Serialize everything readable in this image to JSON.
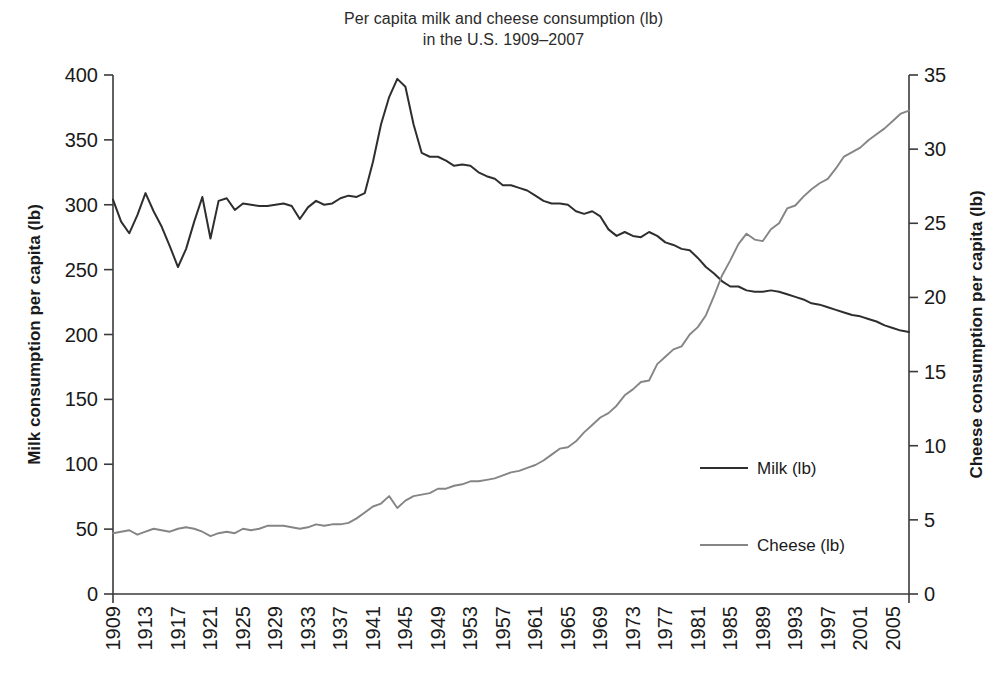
{
  "chart_data": {
    "type": "line",
    "title": "Per capita milk and cheese consumption (lb)",
    "subtitle": "in the U.S. 1909–2007",
    "title_lines": [
      "Per capita milk and cheese consumption (lb)",
      "in the U.S. 1909–2007"
    ],
    "xlabel": "",
    "ylabel": "Milk consumption per capita (lb)",
    "y2label": "Cheese consumption per capita (lb)",
    "xlim": [
      1909,
      2007
    ],
    "ylim": [
      0,
      400
    ],
    "y2lim": [
      0,
      35
    ],
    "yticks": [
      0,
      50,
      100,
      150,
      200,
      250,
      300,
      350,
      400
    ],
    "y2ticks": [
      0,
      5,
      10,
      15,
      20,
      25,
      30,
      35
    ],
    "xticks": [
      1909,
      1913,
      1917,
      1921,
      1925,
      1929,
      1933,
      1937,
      1941,
      1945,
      1949,
      1953,
      1957,
      1961,
      1965,
      1969,
      1973,
      1977,
      1981,
      1985,
      1989,
      1993,
      1997,
      2001,
      2005
    ],
    "xtick_labels": [
      "1909",
      "1913",
      "1917",
      "1921",
      "1925",
      "1929",
      "1933",
      "1937",
      "1941",
      "1945",
      "1949",
      "1953",
      "1957",
      "1961",
      "1965",
      "1969",
      "1973",
      "1977",
      "1981",
      "1985",
      "1989",
      "1993",
      "1997",
      "2001",
      "2005"
    ],
    "grid": false,
    "legend_position": "center-right",
    "colors": {
      "milk": "#2e2e2e",
      "cheese": "#858585"
    },
    "x": [
      1909,
      1910,
      1911,
      1912,
      1913,
      1914,
      1915,
      1916,
      1917,
      1918,
      1919,
      1920,
      1921,
      1922,
      1923,
      1924,
      1925,
      1926,
      1927,
      1928,
      1929,
      1930,
      1931,
      1932,
      1933,
      1934,
      1935,
      1936,
      1937,
      1938,
      1939,
      1940,
      1941,
      1942,
      1943,
      1944,
      1945,
      1946,
      1947,
      1948,
      1949,
      1950,
      1951,
      1952,
      1953,
      1954,
      1955,
      1956,
      1957,
      1958,
      1959,
      1960,
      1961,
      1962,
      1963,
      1964,
      1965,
      1966,
      1967,
      1968,
      1969,
      1970,
      1971,
      1972,
      1973,
      1974,
      1975,
      1976,
      1977,
      1978,
      1979,
      1980,
      1981,
      1982,
      1983,
      1984,
      1985,
      1986,
      1987,
      1988,
      1989,
      1990,
      1991,
      1992,
      1993,
      1994,
      1995,
      1996,
      1997,
      1998,
      1999,
      2000,
      2001,
      2002,
      2003,
      2004,
      2005,
      2006,
      2007
    ],
    "series": [
      {
        "name": "Milk (lb)",
        "axis": "left",
        "color": "#2e2e2e",
        "values": [
          304,
          287,
          278,
          292,
          309,
          295,
          283,
          268,
          252,
          266,
          287,
          306,
          274,
          303,
          305,
          296,
          301,
          300,
          299,
          299,
          300,
          301,
          299,
          289,
          298,
          303,
          300,
          301,
          305,
          307,
          306,
          309,
          333,
          362,
          383,
          397,
          391,
          362,
          340,
          337,
          337,
          334,
          330,
          331,
          330,
          325,
          322,
          320,
          315,
          315,
          313,
          311,
          307,
          303,
          301,
          301,
          300,
          295,
          293,
          295,
          291,
          281,
          276,
          279,
          276,
          275,
          279,
          276,
          271,
          269,
          266,
          265,
          259,
          252,
          247,
          241,
          237,
          237,
          234,
          233,
          233,
          234,
          233,
          231,
          229,
          227,
          224,
          223,
          221,
          219,
          217,
          215,
          214,
          212,
          210,
          207,
          205,
          203,
          202
        ]
      },
      {
        "name": "Cheese (lb)",
        "axis": "right",
        "color": "#858585",
        "values": [
          4.1,
          4.2,
          4.3,
          4.0,
          4.2,
          4.4,
          4.3,
          4.2,
          4.4,
          4.5,
          4.4,
          4.2,
          3.9,
          4.1,
          4.2,
          4.1,
          4.4,
          4.3,
          4.4,
          4.6,
          4.6,
          4.6,
          4.5,
          4.4,
          4.5,
          4.7,
          4.6,
          4.7,
          4.7,
          4.8,
          5.1,
          5.5,
          5.9,
          6.1,
          6.6,
          5.8,
          6.3,
          6.6,
          6.7,
          6.8,
          7.1,
          7.1,
          7.3,
          7.4,
          7.6,
          7.6,
          7.7,
          7.8,
          8.0,
          8.2,
          8.3,
          8.5,
          8.7,
          9.0,
          9.4,
          9.8,
          9.9,
          10.3,
          10.9,
          11.4,
          11.9,
          12.2,
          12.7,
          13.4,
          13.8,
          14.3,
          14.4,
          15.5,
          16.0,
          16.5,
          16.7,
          17.5,
          18.0,
          18.8,
          20.1,
          21.5,
          22.5,
          23.6,
          24.3,
          23.9,
          23.8,
          24.6,
          25.0,
          26.0,
          26.2,
          26.8,
          27.3,
          27.7,
          28.0,
          28.7,
          29.5,
          29.8,
          30.1,
          30.6,
          31.0,
          31.4,
          31.9,
          32.4,
          32.6
        ]
      }
    ]
  },
  "legend": {
    "items": [
      {
        "label": "Milk (lb)",
        "color": "#2e2e2e"
      },
      {
        "label": "Cheese (lb)",
        "color": "#858585"
      }
    ]
  }
}
